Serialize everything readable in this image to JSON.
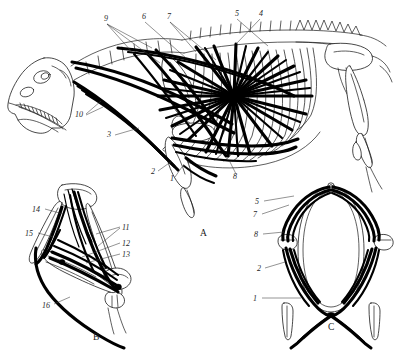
{
  "figure": {
    "background_color": "#ffffff",
    "ink_color": "#1a1a1a",
    "muscle_color": "#000000",
    "leader_color": "#3a3a3a"
  },
  "panels": [
    {
      "id": "A",
      "label": "A",
      "description": "lateral view of skeleton with trunk and forelimb musculature",
      "label_position": {
        "x": 200,
        "y": 236
      }
    },
    {
      "id": "B",
      "label": "B",
      "description": "forelimb flexed, medial view with muscle slips",
      "label_position": {
        "x": 95,
        "y": 338
      }
    },
    {
      "id": "C",
      "label": "C",
      "description": "anterior / cranial view of pectoral girdle and both forelimbs",
      "label_position": {
        "x": 331,
        "y": 327
      }
    }
  ],
  "callouts": {
    "panel_a": [
      {
        "number": "9",
        "x": 104,
        "y": 21,
        "leaders": [
          [
            107,
            24,
            132,
            52
          ],
          [
            107,
            24,
            152,
            48
          ],
          [
            107,
            24,
            160,
            63
          ]
        ]
      },
      {
        "number": "6",
        "x": 142,
        "y": 19,
        "leaders": [
          [
            145,
            22,
            186,
            58
          ]
        ]
      },
      {
        "number": "7",
        "x": 167,
        "y": 19,
        "leaders": [
          [
            170,
            22,
            196,
            52
          ],
          [
            170,
            22,
            216,
            60
          ]
        ]
      },
      {
        "number": "5",
        "x": 235,
        "y": 16,
        "leaders": [
          [
            237,
            19,
            268,
            46
          ]
        ]
      },
      {
        "number": "4",
        "x": 259,
        "y": 16,
        "leaders": [
          [
            260,
            19,
            236,
            44
          ]
        ]
      },
      {
        "number": "10",
        "x": 77,
        "y": 117,
        "leaders": [
          [
            86,
            114,
            101,
            101
          ],
          [
            86,
            115,
            103,
            106
          ]
        ]
      },
      {
        "number": "3",
        "x": 108,
        "y": 137,
        "leaders": [
          [
            115,
            135,
            139,
            128
          ]
        ]
      },
      {
        "number": "2",
        "x": 152,
        "y": 173,
        "leaders": [
          [
            158,
            171,
            172,
            161
          ]
        ]
      },
      {
        "number": "1",
        "x": 171,
        "y": 179,
        "leaders": [
          [
            175,
            176,
            183,
            163
          ]
        ]
      },
      {
        "number": "8",
        "x": 235,
        "y": 177,
        "leaders": [
          [
            236,
            174,
            230,
            161
          ]
        ]
      }
    ],
    "panel_b": [
      {
        "number": "14",
        "x": 34,
        "y": 210,
        "leaders": [
          [
            45,
            209,
            63,
            214
          ]
        ]
      },
      {
        "number": "15",
        "x": 27,
        "y": 234,
        "leaders": [
          [
            38,
            233,
            52,
            236
          ]
        ]
      },
      {
        "number": "11",
        "x": 122,
        "y": 228,
        "leaders": [
          [
            120,
            227,
            96,
            234
          ],
          [
            120,
            228,
            98,
            245
          ]
        ]
      },
      {
        "number": "12",
        "x": 122,
        "y": 243,
        "leaders": [
          [
            120,
            243,
            82,
            256
          ]
        ]
      },
      {
        "number": "13",
        "x": 122,
        "y": 254,
        "leaders": [
          [
            120,
            254,
            86,
            262
          ]
        ]
      },
      {
        "number": "16",
        "x": 44,
        "y": 306,
        "leaders": [
          [
            54,
            304,
            69,
            297
          ]
        ]
      }
    ],
    "panel_c": [
      {
        "number": "5",
        "x": 256,
        "y": 203,
        "leaders": [
          [
            264,
            201,
            293,
            196
          ]
        ]
      },
      {
        "number": "7",
        "x": 254,
        "y": 215,
        "leaders": [
          [
            262,
            213,
            288,
            205
          ]
        ]
      },
      {
        "number": "8",
        "x": 255,
        "y": 235,
        "leaders": [
          [
            263,
            233,
            283,
            231
          ]
        ]
      },
      {
        "number": "2",
        "x": 258,
        "y": 269,
        "leaders": [
          [
            265,
            267,
            284,
            261
          ]
        ]
      },
      {
        "number": "1",
        "x": 254,
        "y": 299,
        "leaders": [
          [
            262,
            297,
            300,
            297
          ]
        ]
      }
    ]
  },
  "legend_numbers": [
    "1",
    "2",
    "3",
    "4",
    "5",
    "6",
    "7",
    "8",
    "9",
    "10",
    "11",
    "12",
    "13",
    "14",
    "15",
    "16"
  ]
}
